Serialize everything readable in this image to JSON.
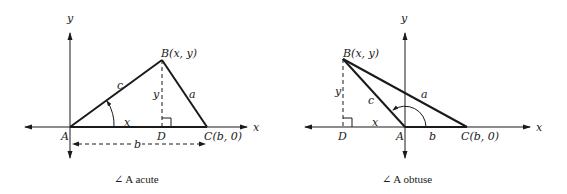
{
  "diagrams": {
    "acute": {
      "caption": "∠ A acute",
      "axis_x_label": "x",
      "axis_y_label": "y",
      "points": {
        "A": "A",
        "B": "B(x, y)",
        "C": "C(b, 0)",
        "D": "D"
      },
      "sides": {
        "a": "a",
        "c": "c",
        "x": "x",
        "y": "y",
        "b": "b"
      }
    },
    "obtuse": {
      "caption": "∠ A obtuse",
      "axis_x_label": "x",
      "axis_y_label": "y",
      "points": {
        "A": "A",
        "B": "B(x, y)",
        "C": "C(b, 0)",
        "D": "D"
      },
      "sides": {
        "a": "a",
        "c": "c",
        "x": "x",
        "y": "y",
        "b": "b"
      }
    }
  },
  "colors": {
    "ink": "#1a1a1a",
    "background": "#ffffff"
  }
}
